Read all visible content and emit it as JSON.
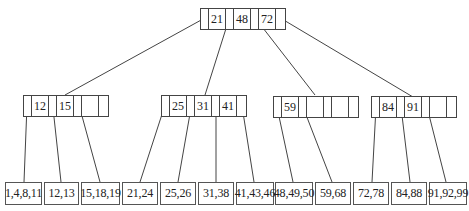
{
  "diagram": {
    "type": "B-tree",
    "root": {
      "keys": [
        "21",
        "48",
        "72"
      ]
    },
    "internal_nodes": [
      {
        "keys": [
          "12",
          "15",
          "",
          ""
        ]
      },
      {
        "keys": [
          "25",
          "31",
          "41",
          ""
        ]
      },
      {
        "keys": [
          "59",
          "",
          "",
          ""
        ]
      },
      {
        "keys": [
          "84",
          "91",
          "",
          ""
        ]
      }
    ],
    "leaves": [
      "1,4,8,11",
      "12,13",
      "15,18,19",
      "21,24",
      "25,26",
      "31,38",
      "41,43,46",
      "48,49,50",
      "59,68",
      "72,78",
      "84,88",
      "91,92,99"
    ]
  }
}
